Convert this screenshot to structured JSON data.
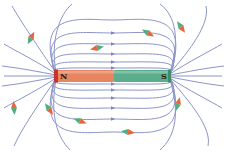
{
  "diagram": {
    "magnet": {
      "north_label": "N",
      "south_label": "S",
      "north_color": "#e8845f",
      "north_cap_color": "#c8312c",
      "south_color": "#5aae8c",
      "south_cap_color": "#3d8c6c",
      "label_color": "#2a1a10"
    },
    "field_line_color": "#8c94c9",
    "arrow_color": "#7a84c2",
    "compass": {
      "north_color": "#e8643c",
      "south_color": "#4fae82"
    },
    "compasses": [
      {
        "x": 31,
        "y": 38,
        "angle": -62
      },
      {
        "x": 97,
        "y": 48,
        "angle": 168
      },
      {
        "x": 148,
        "y": 33,
        "angle": 30
      },
      {
        "x": 181,
        "y": 27,
        "angle": 55
      },
      {
        "x": 14,
        "y": 108,
        "angle": -95
      },
      {
        "x": 49,
        "y": 109,
        "angle": 55
      },
      {
        "x": 80,
        "y": 121,
        "angle": 20
      },
      {
        "x": 128,
        "y": 132,
        "angle": 8
      },
      {
        "x": 178,
        "y": 104,
        "angle": -75
      }
    ]
  }
}
